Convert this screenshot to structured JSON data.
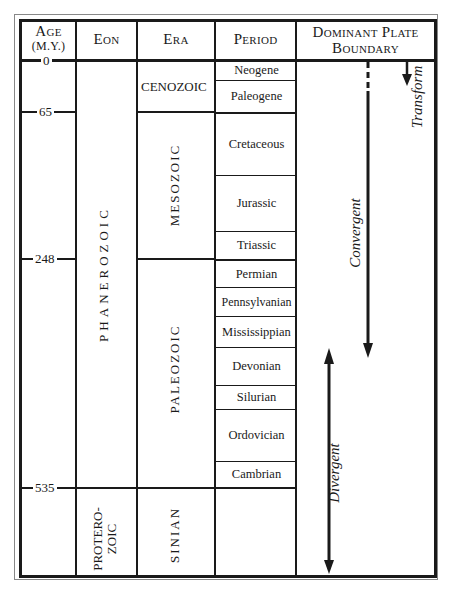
{
  "header": {
    "age_label": "Age",
    "age_unit": "(M.Y.)",
    "eon_label": "Eon",
    "era_label": "Era",
    "period_label": "Period",
    "boundary_label_line1": "Dominant Plate",
    "boundary_label_line2": "Boundary"
  },
  "ages": [
    "0",
    "65",
    "248",
    "535"
  ],
  "eons": {
    "phanerozoic": "PHANEROZOIC",
    "proterozoic_line1": "PROTERO-",
    "proterozoic_line2": "ZOIC"
  },
  "eras": {
    "cenozoic": "CENOZOIC",
    "mesozoic": "MESOZOIC",
    "paleozoic": "PALEOZOIC",
    "sinian": "SINIAN"
  },
  "periods": [
    "Neogene",
    "Paleogene",
    "Cretaceous",
    "Jurassic",
    "Triassic",
    "Permian",
    "Pennsylvanian",
    "Mississippian",
    "Devonian",
    "Silurian",
    "Ordovician",
    "Cambrian"
  ],
  "boundaries": {
    "convergent": "Convergent",
    "transform": "Transform",
    "divergent": "Divergent"
  }
}
